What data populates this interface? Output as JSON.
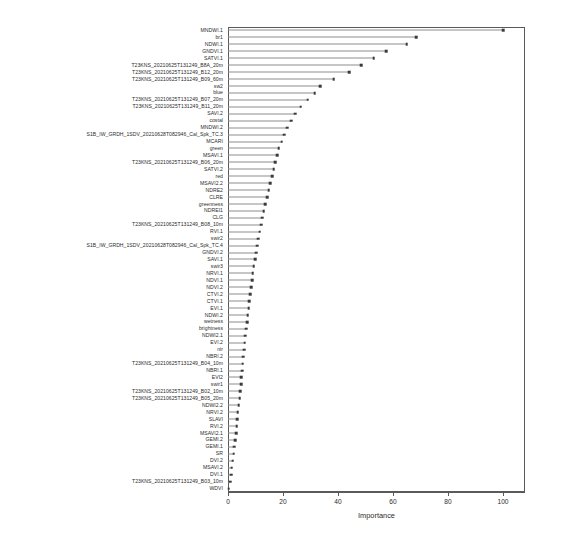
{
  "chart_data": {
    "type": "bar",
    "title": "",
    "subtitle": "",
    "xlabel": "Importance",
    "ylabel": "",
    "xlim": [
      0,
      108
    ],
    "ylim": [
      0,
      68
    ],
    "grid": false,
    "legend": null,
    "orientation": "horizontal",
    "style": "dotchart",
    "xticks": [
      0,
      20,
      40,
      60,
      80,
      100
    ],
    "xticklabels": [
      "0",
      "20",
      "40",
      "60",
      "80",
      "100"
    ],
    "categories": [
      "MNDWI.1",
      "br1",
      "NDWI.1",
      "GNDVI.1",
      "SATVI.1",
      "T23KNS_20210625T131249_B8A_20m",
      "T23KNS_20210625T131249_B12_20m",
      "T23KNS_20210625T131249_B09_60m",
      "sw2",
      "blue",
      "T23KNS_20210625T131249_B07_20m",
      "T23KNS_20210625T131249_B11_20m",
      "SAVI.2",
      "costal",
      "MNDWI.2",
      "S1B_IW_GRDH_1SDV_20210628T082946_Cal_Spk_TC.3",
      "MCARI",
      "green",
      "MSAVI.1",
      "T23KNS_20210625T131249_B06_20m",
      "SATVI.2",
      "red",
      "MSAVI2.2",
      "NDRE2",
      "CLRE",
      "greenness",
      "NDREI1",
      "CLG",
      "T23KNS_20210625T131249_B08_10m",
      "RVI.1",
      "swir2",
      "S1B_IW_GRDH_1SDV_20210628T082946_Cal_Spk_TC.4",
      "GNDVI.2",
      "SAVI.1",
      "swir3",
      "NRVI.1",
      "NDVI.1",
      "NDVI.2",
      "CTVI.2",
      "CTVI.1",
      "EVI.1",
      "NDWI.2",
      "wetness",
      "brightness",
      "NDWI2.1",
      "EVI.2",
      "nir",
      "NBRI.2",
      "T23KNS_20210625T131249_B04_10m",
      "NBRI.1",
      "EVI2",
      "swir1",
      "T23KNS_20210625T131249_B02_10m",
      "T23KNS_20210625T131249_B05_20m",
      "NDWI2.2",
      "NRVI.2",
      "SLAVI",
      "RVI.2",
      "MSAVI2.1",
      "GEMI.2",
      "GEMI.1",
      "SR",
      "DVI.2",
      "MSAVI.2",
      "DVI.1",
      "T23KNS_20210625T131249_B03_10m",
      "WDVI"
    ],
    "values": [
      100.0,
      68.5,
      65.0,
      57.5,
      53.0,
      48.5,
      44.0,
      38.5,
      33.5,
      31.5,
      29.0,
      26.5,
      24.5,
      23.0,
      21.5,
      20.5,
      19.5,
      18.5,
      17.8,
      17.2,
      16.6,
      16.0,
      15.4,
      14.8,
      14.2,
      13.6,
      13.0,
      12.5,
      12.0,
      11.5,
      11.0,
      10.6,
      10.2,
      9.8,
      9.4,
      9.0,
      8.7,
      8.4,
      8.1,
      7.8,
      7.5,
      7.2,
      6.9,
      6.6,
      6.3,
      6.0,
      5.8,
      5.6,
      5.4,
      5.1,
      4.9,
      4.7,
      4.4,
      4.2,
      3.9,
      3.6,
      3.4,
      3.1,
      2.9,
      2.6,
      2.3,
      2.0,
      1.7,
      1.4,
      1.1,
      0.7,
      0.3
    ]
  },
  "axis": {
    "x_label": "Importance"
  }
}
